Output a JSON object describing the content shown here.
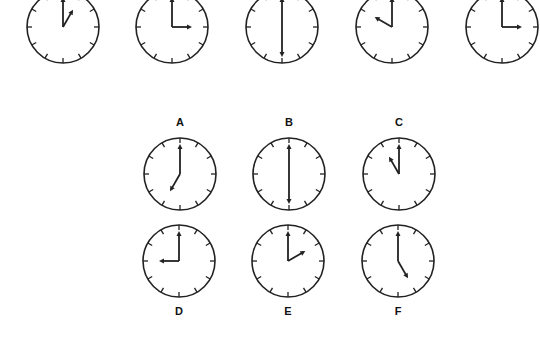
{
  "puzzle": {
    "sequence": [
      {
        "hour": 1,
        "minute": 0,
        "cx": 63,
        "cy": 27
      },
      {
        "hour": 3,
        "minute": 0,
        "cx": 172,
        "cy": 27
      },
      {
        "hour": 6,
        "minute": 0,
        "cx": 282,
        "cy": 27
      },
      {
        "hour": 10,
        "minute": 0,
        "cx": 392,
        "cy": 27
      },
      {
        "hour": 3,
        "minute": 0,
        "cx": 502,
        "cy": 27
      }
    ],
    "options": [
      {
        "label": "A",
        "hour": 7,
        "minute": 0,
        "cx": 180,
        "cy": 174,
        "label_y": 116
      },
      {
        "label": "B",
        "hour": 6,
        "minute": 0,
        "cx": 289,
        "cy": 174,
        "label_y": 116
      },
      {
        "label": "C",
        "hour": 11,
        "minute": 0,
        "cx": 399,
        "cy": 174,
        "label_y": 116
      },
      {
        "label": "D",
        "hour": 9,
        "minute": 0,
        "cx": 179,
        "cy": 261,
        "label_y": 305
      },
      {
        "label": "E",
        "hour": 2,
        "minute": 0,
        "cx": 288,
        "cy": 261,
        "label_y": 305
      },
      {
        "label": "F",
        "hour": 5,
        "minute": 0,
        "cx": 398,
        "cy": 261,
        "label_y": 305
      }
    ]
  },
  "colors": {
    "ink": "#222222",
    "background": "#ffffff"
  }
}
